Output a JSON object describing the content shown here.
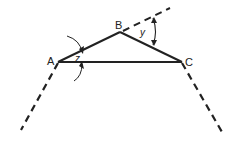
{
  "diagram": {
    "type": "triangle-exterior-angles",
    "vertices": {
      "A": {
        "label": "A",
        "x": 58,
        "y": 62
      },
      "B": {
        "label": "B",
        "x": 120,
        "y": 32
      },
      "C": {
        "label": "C",
        "x": 182,
        "y": 62
      }
    },
    "angles": {
      "z": {
        "label": "z",
        "at": "A"
      },
      "y": {
        "label": "y",
        "at": "B",
        "kind": "exterior"
      }
    },
    "colors": {
      "stroke": "#222222",
      "background": "#ffffff"
    }
  }
}
